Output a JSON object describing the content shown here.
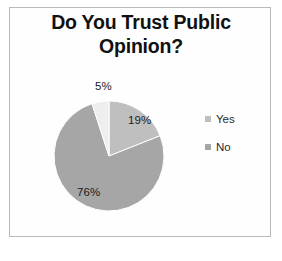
{
  "figure": {
    "background_color": "#ffffff",
    "frame_border_color": "#b9b9bb"
  },
  "title": {
    "line1": "Do You Trust Public",
    "line2": "Opinion?"
  },
  "legend": {
    "position": "right",
    "items": [
      {
        "label": "Yes",
        "color": "#bfbfbf"
      },
      {
        "label": "No",
        "color": "#a6a6a6"
      }
    ]
  },
  "chart_data": {
    "type": "pie",
    "title": "Do You Trust Public Opinion?",
    "xlabel": "",
    "ylabel": "",
    "categories": [
      "Yes",
      "No",
      "Other"
    ],
    "values": [
      19,
      76,
      5
    ],
    "data_labels": [
      "19%",
      "76%",
      "5%"
    ],
    "colors": [
      "#bfbfbf",
      "#a6a6a6",
      "#eeeeee"
    ],
    "legend_entries": [
      "Yes",
      "No"
    ],
    "legend_position": "right",
    "grid": false,
    "start_angle_deg": 0,
    "direction": "clockwise"
  }
}
